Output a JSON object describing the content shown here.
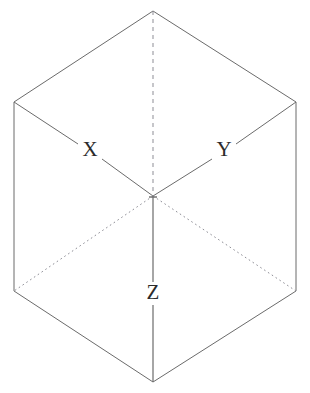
{
  "figure": {
    "type": "isometric-cube-axes-diagram",
    "background_color": "#ffffff",
    "line_color": "#6b6b6b",
    "label_color": "#2b2b2b",
    "labels": {
      "x": "X",
      "y": "Y",
      "z": "Z"
    },
    "geometry": {
      "top_vertex": [
        153,
        11
      ],
      "upper_left_corner": [
        14,
        102
      ],
      "upper_right_corner": [
        296,
        102
      ],
      "center_vertex": [
        153,
        196
      ],
      "lower_left_corner": [
        14,
        291
      ],
      "lower_right_corner": [
        296,
        291
      ],
      "bottom_vertex": [
        153,
        382
      ]
    },
    "edges": [
      {
        "name": "outline-top-left",
        "from": "top_vertex",
        "to": "upper_left_corner",
        "style": "solid"
      },
      {
        "name": "outline-top-right",
        "from": "top_vertex",
        "to": "upper_right_corner",
        "style": "solid"
      },
      {
        "name": "outline-left-side",
        "from": "upper_left_corner",
        "to": "lower_left_corner",
        "style": "solid"
      },
      {
        "name": "outline-right-side",
        "from": "upper_right_corner",
        "to": "lower_right_corner",
        "style": "solid"
      },
      {
        "name": "outline-bottom-left",
        "from": "lower_left_corner",
        "to": "bottom_vertex",
        "style": "solid"
      },
      {
        "name": "outline-bottom-right",
        "from": "lower_right_corner",
        "to": "bottom_vertex",
        "style": "solid"
      },
      {
        "name": "axis-x",
        "from": "upper_left_corner",
        "to": "center_vertex",
        "style": "solid",
        "label": "X"
      },
      {
        "name": "axis-y",
        "from": "upper_right_corner",
        "to": "center_vertex",
        "style": "solid",
        "label": "Y"
      },
      {
        "name": "axis-z",
        "from": "center_vertex",
        "to": "bottom_vertex",
        "style": "solid",
        "label": "Z"
      },
      {
        "name": "hidden-vertical",
        "from": "top_vertex",
        "to": "center_vertex",
        "style": "dashed"
      },
      {
        "name": "hidden-lower-left",
        "from": "center_vertex",
        "to": "lower_left_corner",
        "style": "dotted"
      },
      {
        "name": "hidden-lower-right",
        "from": "center_vertex",
        "to": "lower_right_corner",
        "style": "dotted"
      }
    ]
  }
}
